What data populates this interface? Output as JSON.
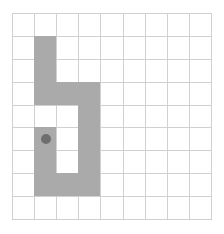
{
  "grid": {
    "cols": 9,
    "rows": 9,
    "colors": {
      "background": "#ffffff",
      "grid_line": "#d0d0d0",
      "filled": "#aaaaaa",
      "agent": "#6e6e6e"
    },
    "filled_cells": [
      [
        1,
        1
      ],
      [
        1,
        2
      ],
      [
        1,
        3
      ],
      [
        2,
        3
      ],
      [
        3,
        3
      ],
      [
        3,
        4
      ],
      [
        1,
        5
      ],
      [
        3,
        5
      ],
      [
        1,
        6
      ],
      [
        3,
        6
      ],
      [
        1,
        7
      ],
      [
        2,
        7
      ],
      [
        3,
        7
      ]
    ],
    "agent": {
      "col": 1,
      "row": 5
    }
  }
}
